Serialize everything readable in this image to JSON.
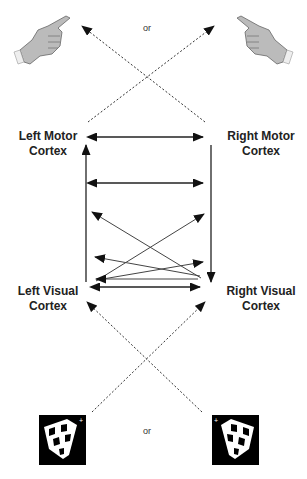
{
  "diagram": {
    "top_or": "or",
    "bottom_or": "or",
    "labels": {
      "left_motor": [
        "Left Motor",
        "Cortex"
      ],
      "right_motor": [
        "Right Motor",
        "Cortex"
      ],
      "left_visual": [
        "Left Visual",
        "Cortex"
      ],
      "right_visual": [
        "Right Visual",
        "Cortex"
      ]
    },
    "icons": {
      "top_left": "left-pointing-hand-icon",
      "top_right": "right-pointing-hand-icon",
      "bottom_left": "checkerboard-wedge-left-icon",
      "bottom_right": "checkerboard-wedge-right-icon"
    },
    "colors": {
      "line": "#222222",
      "dotted": "#333333",
      "text": "#222222"
    }
  }
}
